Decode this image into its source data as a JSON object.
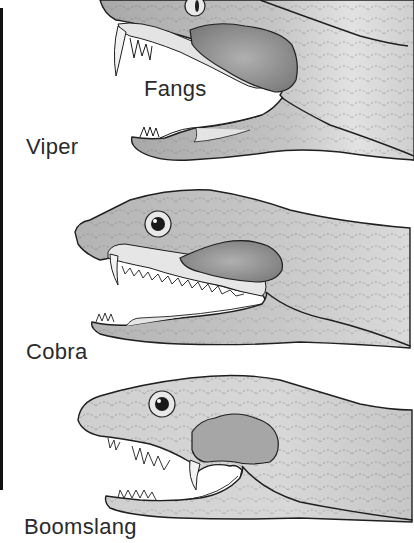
{
  "diagram": {
    "panels": [
      {
        "id": "viper",
        "label": "Viper",
        "annotation": "Fangs"
      },
      {
        "id": "cobra",
        "label": "Cobra"
      },
      {
        "id": "boomslang",
        "label": "Boomslang"
      }
    ]
  },
  "colors": {
    "background": "#ffffff",
    "outline": "#1e1e1e",
    "skin": "#c9c9c9",
    "skin_dark": "#9a9a9a",
    "mouth": "#e6e6e6",
    "venom_gland": "#8f8f8f",
    "text": "#2a2a2a"
  }
}
